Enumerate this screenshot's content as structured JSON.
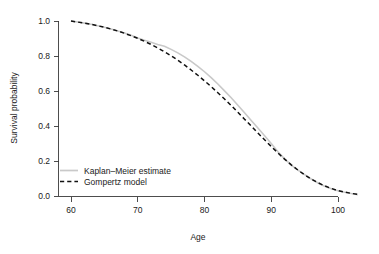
{
  "chart_data": {
    "type": "line",
    "title": "",
    "xlabel": "Age",
    "ylabel": "Survival probability",
    "xlim": [
      58.3,
      104.0
    ],
    "ylim": [
      0.0,
      1.0
    ],
    "grid": false,
    "legend_position": "bottom-left",
    "xticks": [
      60,
      70,
      80,
      90,
      100
    ],
    "xtick_labels": [
      "60",
      "70",
      "80",
      "90",
      "100"
    ],
    "yticks": [
      0.0,
      0.2,
      0.4,
      0.6,
      0.8,
      1.0
    ],
    "ytick_labels": [
      "0.0",
      "0.2",
      "0.4",
      "0.6",
      "0.8",
      "1.0"
    ],
    "x": [
      60,
      61,
      62,
      63,
      64,
      65,
      66,
      67,
      68,
      69,
      70,
      71,
      72,
      73,
      74,
      75,
      76,
      77,
      78,
      79,
      80,
      81,
      82,
      83,
      84,
      85,
      86,
      87,
      88,
      89,
      90,
      91,
      92,
      93,
      94,
      95,
      96,
      97,
      98,
      99,
      100,
      101,
      102,
      103
    ],
    "series": [
      {
        "name": "Kaplan-Meier estimate",
        "label": "Kaplan–Meier estimate",
        "color": "#c9c9c9",
        "style": "solid",
        "values": [
          1.0,
          0.994,
          0.988,
          0.981,
          0.973,
          0.964,
          0.954,
          0.943,
          0.931,
          0.918,
          0.903,
          0.89,
          0.878,
          0.866,
          0.856,
          0.838,
          0.818,
          0.795,
          0.769,
          0.741,
          0.71,
          0.676,
          0.64,
          0.601,
          0.561,
          0.519,
          0.476,
          0.432,
          0.388,
          0.344,
          0.3,
          0.253,
          0.212,
          0.177,
          0.148,
          0.122,
          0.097,
          0.074,
          0.056,
          0.042,
          0.03,
          0.021,
          0.014,
          0.008
        ]
      },
      {
        "name": "Gompertz model",
        "label": "Gompertz model",
        "color": "#111111",
        "style": "dashed",
        "values": [
          1.0,
          0.994,
          0.988,
          0.981,
          0.973,
          0.964,
          0.954,
          0.943,
          0.93,
          0.916,
          0.901,
          0.884,
          0.866,
          0.846,
          0.824,
          0.801,
          0.776,
          0.749,
          0.72,
          0.69,
          0.658,
          0.625,
          0.59,
          0.554,
          0.517,
          0.478,
          0.439,
          0.4,
          0.36,
          0.321,
          0.283,
          0.246,
          0.211,
          0.178,
          0.148,
          0.121,
          0.097,
          0.076,
          0.058,
          0.043,
          0.031,
          0.022,
          0.015,
          0.009
        ]
      }
    ]
  },
  "legend": {
    "items": [
      {
        "label": "Kaplan–Meier estimate",
        "style": "solid",
        "color": "#c9c9c9"
      },
      {
        "label": "Gompertz model",
        "style": "dashed",
        "color": "#111111"
      }
    ]
  },
  "axes": {
    "x_title": "Age",
    "y_title": "Survival probability"
  }
}
